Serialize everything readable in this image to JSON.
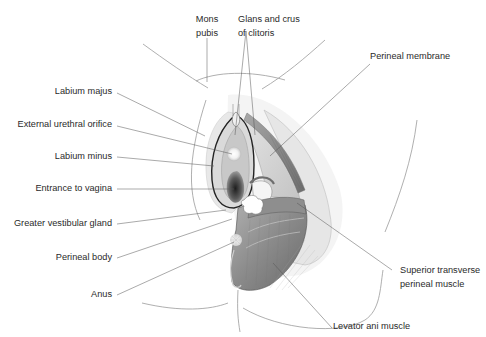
{
  "figure": {
    "labels": {
      "mons_pubis": [
        "Mons",
        "pubis"
      ],
      "glans_crus_clitoris": [
        "Glans and crus",
        "of clitoris"
      ],
      "perineal_membrane": "Perineal membrane",
      "labium_majus": "Labium majus",
      "external_urethral_orifice": "External urethral orifice",
      "labium_minus": "Labium minus",
      "entrance_to_vagina": "Entrance to vagina",
      "greater_vestibular_gland": "Greater vestibular gland",
      "perineal_body": "Perineal body",
      "anus": "Anus",
      "superior_transverse_perineal_muscle": [
        "Superior transverse",
        "perineal muscle"
      ],
      "levator_ani_muscle": "Levator ani muscle"
    },
    "colors": {
      "label_text": "#2a2a2a",
      "leader_line": "#555555",
      "outline": "#8a8a8a",
      "muscle_dark": "#6e6e6e",
      "muscle_mid": "#9a9a9a",
      "skin_light": "#ececec",
      "vagina_dark": "#3a3a3a"
    }
  }
}
